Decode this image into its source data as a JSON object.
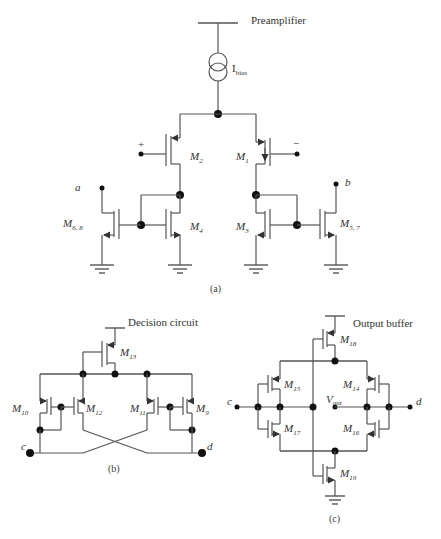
{
  "figure": {
    "panels": [
      {
        "id": "a",
        "caption": "(a)",
        "title": "Preamplifier",
        "bias_source": {
          "symbol": "I",
          "subscript": "bias"
        },
        "terminals": {
          "plus": "+",
          "minus": "−",
          "a": "a",
          "b": "b"
        },
        "transistors": [
          {
            "name": "M",
            "sub": "2"
          },
          {
            "name": "M",
            "sub": "1"
          },
          {
            "name": "M",
            "sub": "4"
          },
          {
            "name": "M",
            "sub": "3"
          },
          {
            "name": "M",
            "sub": "6, 8"
          },
          {
            "name": "M",
            "sub": "5, 7"
          }
        ]
      },
      {
        "id": "b",
        "caption": "(b)",
        "title": "Decision circuit",
        "terminals": {
          "c": "c",
          "d": "d"
        },
        "transistors": [
          {
            "name": "M",
            "sub": "13"
          },
          {
            "name": "M",
            "sub": "10"
          },
          {
            "name": "M",
            "sub": "12"
          },
          {
            "name": "M",
            "sub": "11"
          },
          {
            "name": "M",
            "sub": "9"
          }
        ]
      },
      {
        "id": "c",
        "caption": "(c)",
        "title": "Output buffer",
        "terminals": {
          "c": "c",
          "d": "d",
          "vout": "V",
          "vout_sub": "out"
        },
        "transistors": [
          {
            "name": "M",
            "sub": "18"
          },
          {
            "name": "M",
            "sub": "15"
          },
          {
            "name": "M",
            "sub": "14"
          },
          {
            "name": "M",
            "sub": "17"
          },
          {
            "name": "M",
            "sub": "16"
          },
          {
            "name": "M",
            "sub": "19"
          }
        ]
      }
    ]
  }
}
